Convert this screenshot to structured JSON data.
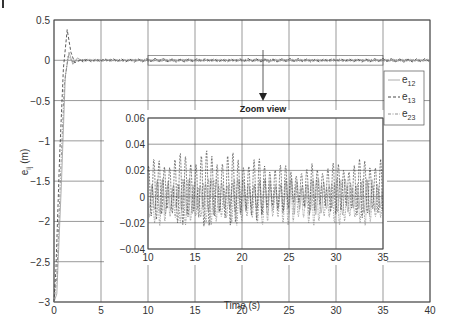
{
  "chart_data": [
    {
      "type": "line",
      "title": "",
      "xlabel": "Time (s)",
      "ylabel": "e_ij (m)",
      "xlim": [
        0,
        40
      ],
      "ylim": [
        -3,
        0.5
      ],
      "xticks": [
        0,
        5,
        10,
        15,
        20,
        25,
        30,
        35,
        40
      ],
      "yticks": [
        0.5,
        0,
        -0.5,
        -1,
        -1.5,
        -2,
        -2.5,
        -3
      ],
      "xtick_labels": [
        "0",
        "5",
        "10",
        "15",
        "20",
        "25",
        "30",
        "35",
        "40"
      ],
      "ytick_labels": [
        "0.5",
        "0",
        "−0.5",
        "−1",
        "−1.5",
        "−2",
        "−2.5",
        "−3"
      ],
      "grid": true,
      "legend": {
        "position": "right",
        "entries": [
          "e12",
          "e13",
          "e23"
        ]
      },
      "series": [
        {
          "name": "e12",
          "style": "solid-light",
          "x": [
            0,
            0.3,
            0.8,
            1.2,
            1.6,
            2.0,
            2.5,
            3,
            5,
            10,
            20,
            30,
            40
          ],
          "y": [
            -3.0,
            -2.9,
            -1.5,
            -0.2,
            0.1,
            -0.05,
            0.03,
            -0.01,
            0.01,
            -0.01,
            0.01,
            -0.01,
            0.0
          ]
        },
        {
          "name": "e13",
          "style": "dashed",
          "x": [
            0,
            0.2,
            0.6,
            1.0,
            1.4,
            1.8,
            2.2,
            3,
            5,
            10,
            20,
            30,
            40
          ],
          "y": [
            -3.0,
            -2.6,
            -1.2,
            -0.1,
            0.38,
            0.1,
            -0.03,
            0.01,
            -0.01,
            0.02,
            -0.01,
            0.02,
            0.0
          ]
        },
        {
          "name": "e23",
          "style": "dash-dot",
          "x": [
            0,
            0.3,
            0.7,
            1.1,
            1.5,
            2.0,
            3,
            5,
            10,
            20,
            30,
            40
          ],
          "y": [
            -3.0,
            -2.7,
            -1.4,
            -0.3,
            0.05,
            -0.02,
            0.01,
            -0.01,
            0.01,
            -0.01,
            0.01,
            0.0
          ]
        }
      ],
      "annotations": [
        {
          "text": "Zoom view",
          "arrow_from": [
            22.5,
            0.02
          ],
          "arrow_to": [
            22.5,
            -0.55
          ]
        }
      ],
      "zoom_box": {
        "x": [
          10,
          35
        ],
        "y": [
          -0.02,
          0.02
        ]
      }
    },
    {
      "type": "line",
      "title": "Zoom view (inset)",
      "xlim": [
        10,
        35
      ],
      "ylim": [
        -0.04,
        0.06
      ],
      "xticks": [
        10,
        15,
        20,
        25,
        30,
        35
      ],
      "yticks": [
        0.06,
        0.04,
        0.02,
        0,
        -0.02,
        -0.04
      ],
      "xtick_labels": [
        "10",
        "15",
        "20",
        "25",
        "30",
        "35"
      ],
      "ytick_labels": [
        "0.06",
        "0.04",
        "0.02",
        "0",
        "−0.02",
        "−0.04"
      ],
      "grid": true,
      "series": [
        {
          "name": "e12",
          "description": "oscillation approx ±0.015 m",
          "amplitude": 0.015
        },
        {
          "name": "e13",
          "description": "dashed oscillation, peaks 0.02–0.04 m, troughs ~−0.02 m",
          "peak_max": 0.04,
          "trough_min": -0.03
        },
        {
          "name": "e23",
          "description": "oscillation approx ±0.02 m",
          "amplitude": 0.02
        }
      ]
    }
  ],
  "labels": {
    "xlabel": "Time (s)",
    "ylabel_main": "e",
    "ylabel_sub": "ij",
    "ylabel_unit": " (m)",
    "annotation": "Zoom view",
    "legend": [
      {
        "base": "e",
        "sub": "12"
      },
      {
        "base": "e",
        "sub": "13"
      },
      {
        "base": "e",
        "sub": "23"
      }
    ]
  },
  "colors": {
    "axis": "#333333",
    "grid": "#555555",
    "e12": "#999999",
    "e13": "#333333",
    "e23": "#777777"
  }
}
